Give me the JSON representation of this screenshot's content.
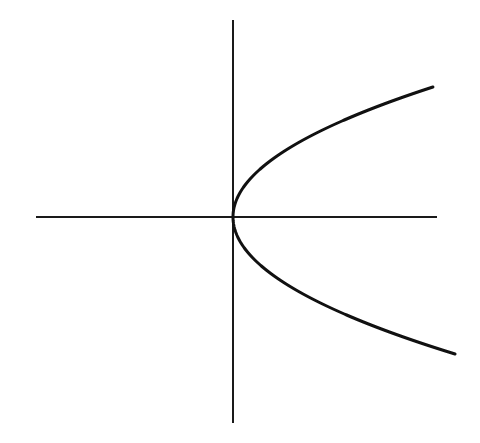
{
  "chart_data": {
    "type": "line",
    "title": "",
    "xlabel": "",
    "ylabel": "",
    "equation": "x = a*y^2",
    "grid": false,
    "legend": null,
    "axes": {
      "origin_px": [
        233,
        217
      ],
      "x_axis_px": {
        "x1": 36,
        "x2": 437,
        "y": 217
      },
      "y_axis_px": {
        "x": 233,
        "y1": 20,
        "y2": 423
      }
    },
    "curve": {
      "vertex_px": [
        233,
        217
      ],
      "coefficient_px": 0.01183,
      "y_range_px": [
        -130,
        137
      ],
      "endpoints_px": [
        [
          433,
          87
        ],
        [
          455,
          354
        ]
      ]
    },
    "colors": {
      "background": "#ffffff",
      "axis": "#1a1a1a",
      "curve": "#111111"
    }
  }
}
